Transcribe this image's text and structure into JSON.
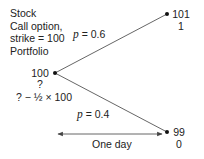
{
  "legend": {
    "lines": [
      "Stock",
      "Call option,",
      "strike = 100",
      "Portfolio"
    ]
  },
  "nodes": {
    "start": {
      "stock": "100",
      "option": "?",
      "portfolio": "? − ½ × 100"
    },
    "up": {
      "stock": "101",
      "option": "1"
    },
    "down": {
      "stock": "99",
      "option": "0"
    }
  },
  "branches": {
    "up": {
      "p_symbol": "p",
      "label": " = 0.6"
    },
    "down": {
      "p_symbol": "p",
      "label": " = 0.4"
    }
  },
  "time_axis": {
    "label": "One day"
  },
  "colors": {
    "line": "#555555",
    "text": "#222222"
  }
}
